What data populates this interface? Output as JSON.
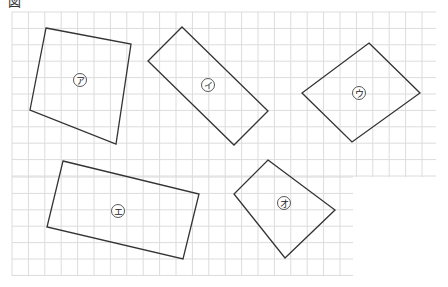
{
  "figure": {
    "heading": "図",
    "grid": {
      "cell_px": 16.4,
      "line_color": "#dcdcdc",
      "upper_region": {
        "x0": 12,
        "y0": 12,
        "x1": 436,
        "y1": 177
      },
      "lower_region": {
        "x0": 12,
        "y0": 177,
        "x1": 353,
        "y1": 276
      }
    },
    "stroke_color": "#333333",
    "shapes": [
      {
        "label": "ア",
        "points": [
          [
            46,
            28
          ],
          [
            131,
            44
          ],
          [
            116,
            144
          ],
          [
            30,
            110
          ]
        ],
        "label_pos": [
          80,
          80
        ]
      },
      {
        "label": "イ",
        "points": [
          [
            182,
            27
          ],
          [
            268,
            111
          ],
          [
            234,
            145
          ],
          [
            148,
            61
          ]
        ],
        "label_pos": [
          208,
          85
        ]
      },
      {
        "label": "ウ",
        "points": [
          [
            369,
            43
          ],
          [
            420,
            93
          ],
          [
            352,
            142
          ],
          [
            302,
            93
          ]
        ],
        "label_pos": [
          359,
          93
        ]
      },
      {
        "label": "エ",
        "points": [
          [
            63,
            161
          ],
          [
            199,
            194
          ],
          [
            183,
            259
          ],
          [
            47,
            227
          ]
        ],
        "label_pos": [
          118,
          211
        ]
      },
      {
        "label": "オ",
        "points": [
          [
            268,
            160
          ],
          [
            335,
            210
          ],
          [
            285,
            258
          ],
          [
            234,
            194
          ]
        ],
        "label_pos": [
          284,
          203
        ]
      }
    ]
  }
}
